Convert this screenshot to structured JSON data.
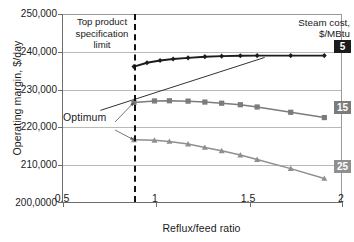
{
  "chart_data": {
    "type": "line",
    "title": "",
    "xlabel": "Reflux/feed ratio",
    "ylabel": "Operating margin, $/day",
    "xlim": [
      0.5,
      2.0
    ],
    "ylim": [
      200000,
      250000
    ],
    "xticks": [
      "0.5",
      "1",
      "1.5",
      "2"
    ],
    "xtick_values": [
      0.5,
      1,
      1.5,
      2
    ],
    "yticks": [
      "250,000",
      "240,000",
      "230,000",
      "220,000",
      "210,000",
      "200,0000"
    ],
    "ytick_values": [
      250000,
      240000,
      230000,
      220000,
      210000,
      200000
    ],
    "grid": "horizontal",
    "legend_position": "right-inside",
    "legend_title": [
      "Steam cost,",
      "$/MBtu"
    ],
    "series": [
      {
        "name": "5",
        "badge": "5",
        "color": "#1c1c1c",
        "marker": "diamond",
        "x": [
          0.88,
          0.95,
          1.02,
          1.09,
          1.17,
          1.26,
          1.35,
          1.45,
          1.54,
          1.72,
          1.9
        ],
        "values": [
          236100,
          237100,
          237700,
          238100,
          238400,
          238700,
          238850,
          238950,
          239000,
          239000,
          239000
        ]
      },
      {
        "name": "15",
        "badge": "15",
        "color": "#7b7b7b",
        "marker": "square",
        "x": [
          0.88,
          0.99,
          1.07,
          1.17,
          1.26,
          1.35,
          1.45,
          1.54,
          1.72,
          1.9
        ],
        "values": [
          226600,
          227000,
          227050,
          226950,
          226700,
          226400,
          226000,
          225400,
          224000,
          222600
        ]
      },
      {
        "name": "25",
        "badge": "25",
        "color": "#8f8f8f",
        "marker": "triangle",
        "x": [
          0.88,
          0.99,
          1.07,
          1.17,
          1.26,
          1.35,
          1.45,
          1.54,
          1.72,
          1.9
        ],
        "values": [
          216700,
          216600,
          216300,
          215600,
          214700,
          213800,
          212700,
          211500,
          209100,
          206500
        ]
      }
    ],
    "extra_lines": [
      {
        "name": "tangent-line",
        "color": "#333333",
        "x": [
          0.7,
          1.58
        ],
        "values": [
          224500,
          238500
        ]
      }
    ],
    "annotations": [
      {
        "name": "spec-limit",
        "text": [
          "Top product",
          "specification",
          "limit"
        ],
        "x_value": 0.88,
        "style": "vertical dashed line"
      },
      {
        "name": "optimum",
        "text": "Optimum",
        "points_to": [
          [
            0.88,
            226600
          ],
          [
            0.88,
            216700
          ]
        ]
      }
    ]
  },
  "axis": {
    "ylabel": "Operating margin, $/day",
    "xlabel": "Reflux/feed ratio"
  },
  "legend": {
    "line1": "Steam cost,",
    "line2": "$/MBtu",
    "badges": [
      "5",
      "15",
      "25"
    ]
  },
  "annotations": {
    "spec_line1": "Top product",
    "spec_line2": "specification",
    "spec_line3": "limit",
    "optimum": "Optimum"
  }
}
